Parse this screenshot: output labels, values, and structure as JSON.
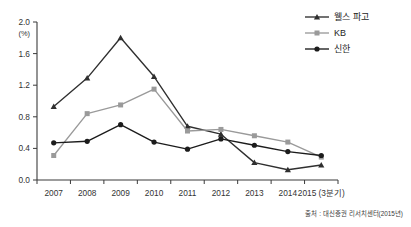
{
  "chart_data": {
    "type": "line",
    "title": "",
    "xlabel": "",
    "ylabel": "",
    "unit_label": "(%)",
    "categories": [
      "2007",
      "2008",
      "2009",
      "2010",
      "2011",
      "2012",
      "2013",
      "2014",
      "2015 (3분기)"
    ],
    "x_tick_labels": [
      "2007",
      "2008",
      "2009",
      "2010",
      "2011",
      "2012",
      "2013",
      "2014",
      "2015 (3분기)"
    ],
    "y_tick_labels": [
      "0.0",
      "0.4",
      "0.8",
      "1.2",
      "1.6",
      "2.0"
    ],
    "y_ticks": [
      0.0,
      0.4,
      0.8,
      1.2,
      1.6,
      2.0
    ],
    "ylim": [
      0.0,
      2.0
    ],
    "grid": false,
    "legend_position": "top-right",
    "series": [
      {
        "name": "웰스 파고",
        "color": "#2f2f2f",
        "marker": "triangle",
        "values": [
          0.93,
          1.29,
          1.8,
          1.31,
          0.68,
          0.58,
          0.22,
          0.13,
          0.19
        ]
      },
      {
        "name": "KB",
        "color": "#9a9a9a",
        "marker": "square",
        "values": [
          0.31,
          0.84,
          0.95,
          1.15,
          0.62,
          0.64,
          0.56,
          0.48,
          0.29
        ]
      },
      {
        "name": "신한",
        "color": "#1c1c1c",
        "marker": "circle",
        "values": [
          0.47,
          0.49,
          0.7,
          0.48,
          0.39,
          0.52,
          0.44,
          0.36,
          0.31
        ]
      }
    ],
    "source": "출처 : 대신증권 리서치센터(2015년)"
  }
}
